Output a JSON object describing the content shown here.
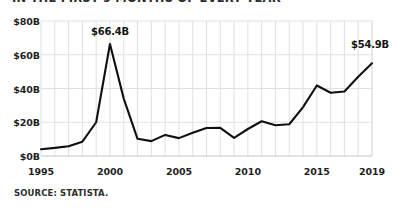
{
  "title": "IN THE FIRST 9 MONTHS OF EVERY YEAR",
  "source": "SOURCE: STATISTA.",
  "style": {
    "line_color": "#101010",
    "grid_color": "#dcdcdc",
    "text_color": "#1a1a1a",
    "background": "#ffffff"
  },
  "annotations": {
    "peak_label": "$66.4B",
    "end_label": "$54.9B"
  },
  "chart_data": {
    "type": "line",
    "title": "IN THE FIRST 9 MONTHS OF EVERY YEAR",
    "xlabel": "",
    "ylabel": "",
    "xlim": [
      1995,
      2019
    ],
    "ylim": [
      0,
      80
    ],
    "grid": true,
    "legend": false,
    "y_ticks": [
      0,
      20,
      40,
      60,
      80
    ],
    "y_tick_labels": [
      "$0B",
      "$20B",
      "$40B",
      "$60B",
      "$80B"
    ],
    "x_ticks": [
      1995,
      2000,
      2005,
      2010,
      2015,
      2019
    ],
    "x_tick_labels": [
      "1995",
      "2000",
      "2005",
      "2010",
      "2015",
      "2019"
    ],
    "x": [
      1995,
      1996,
      1997,
      1998,
      1999,
      2000,
      2001,
      2002,
      2003,
      2004,
      2005,
      2006,
      2007,
      2008,
      2009,
      2010,
      2011,
      2012,
      2013,
      2014,
      2015,
      2016,
      2017,
      2018,
      2019
    ],
    "values": [
      4.0,
      4.8,
      5.8,
      8.5,
      20.0,
      66.4,
      34.0,
      10.2,
      8.8,
      12.5,
      10.6,
      13.8,
      16.6,
      16.7,
      10.7,
      16.0,
      20.6,
      18.2,
      18.8,
      29.0,
      41.8,
      37.5,
      38.2,
      47.0,
      54.9
    ],
    "annotated_points": [
      {
        "x": 2000,
        "y": 66.4,
        "label": "$66.4B"
      },
      {
        "x": 2019,
        "y": 54.9,
        "label": "$54.9B"
      }
    ]
  }
}
